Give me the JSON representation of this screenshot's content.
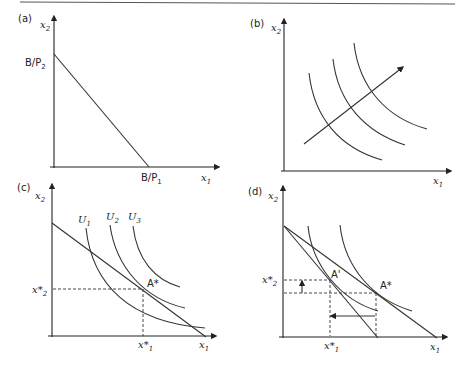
{
  "figure": {
    "top_rule": true,
    "panels": [
      {
        "id": "a",
        "label": "(a)",
        "y_axis": "x",
        "y_axis_sub": "2",
        "x_axis": "x",
        "x_axis_sub": "1",
        "y_intercept_label": "B/P",
        "y_intercept_sub": "2",
        "x_intercept_label": "B/P",
        "x_intercept_sub": "1",
        "description": "Budget line"
      },
      {
        "id": "b",
        "label": "(b)",
        "y_axis": "x",
        "y_axis_sub": "2",
        "x_axis": "x",
        "x_axis_sub": "1",
        "description": "Indifference curves with arrow showing direction of increasing utility"
      },
      {
        "id": "c",
        "label": "(c)",
        "y_axis": "x",
        "y_axis_sub": "2",
        "x_axis": "x",
        "x_axis_sub": "1",
        "curves": [
          {
            "name": "U",
            "sub": "1"
          },
          {
            "name": "U",
            "sub": "2"
          },
          {
            "name": "U",
            "sub": "3"
          }
        ],
        "optimum_label": "A*",
        "x_star": {
          "text": "x*",
          "sub": "1"
        },
        "y_star": {
          "text": "x*",
          "sub": "2"
        }
      },
      {
        "id": "d",
        "label": "(d)",
        "y_axis": "x",
        "y_axis_sub": "2",
        "x_axis": "x",
        "x_axis_sub": "1",
        "new_optimum_label": "A'",
        "old_optimum_label": "A*",
        "x_star": {
          "text": "x*",
          "sub": "1"
        },
        "y_star": {
          "text": "x*",
          "sub": "2"
        }
      }
    ]
  }
}
